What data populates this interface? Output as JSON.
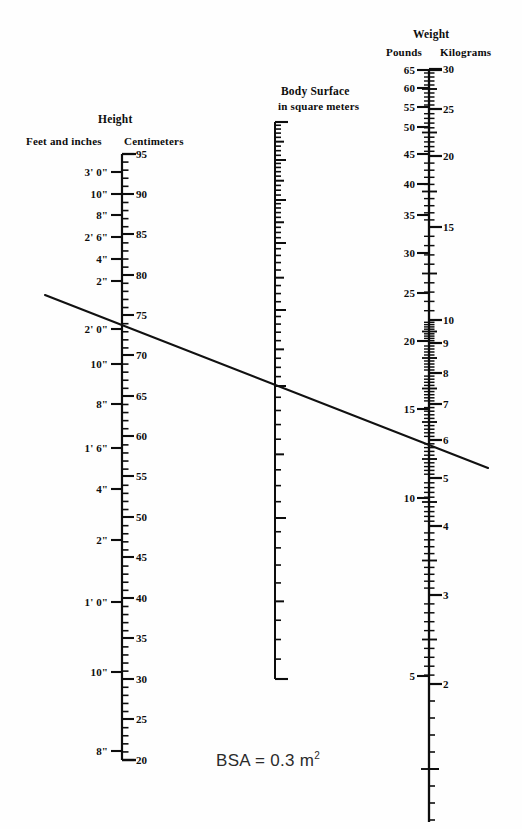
{
  "figure": {
    "kind": "bsa-nomogram",
    "result_text": "BSA = 0.3 m",
    "result_exponent": "2",
    "ink_color": "#0d0d0d",
    "background_color": "#fefefe",
    "reference_line_color": "#111111"
  },
  "height_scale": {
    "title": "Height",
    "left_header": "Feet and inches",
    "right_header": "Centimeters",
    "axis_x": 122,
    "top_y": 154,
    "bottom_y": 760,
    "cm_top": 95,
    "cm_bottom": 20,
    "cm_labels": [
      {
        "value": "95",
        "y": 154
      },
      {
        "value": "90",
        "y": 194
      },
      {
        "value": "85",
        "y": 234
      },
      {
        "value": "80",
        "y": 275
      },
      {
        "value": "75",
        "y": 315
      },
      {
        "value": "70",
        "y": 355
      },
      {
        "value": "65",
        "y": 396
      },
      {
        "value": "60",
        "y": 436
      },
      {
        "value": "55",
        "y": 476
      },
      {
        "value": "50",
        "y": 517
      },
      {
        "value": "45",
        "y": 557
      },
      {
        "value": "40",
        "y": 598
      },
      {
        "value": "35",
        "y": 638
      },
      {
        "value": "30",
        "y": 679
      },
      {
        "value": "25",
        "y": 719
      },
      {
        "value": "20",
        "y": 760
      }
    ],
    "feet_inch_labels": [
      {
        "value": "3' 0\"",
        "y": 172
      },
      {
        "value": "10\"",
        "y": 194
      },
      {
        "value": "8\"",
        "y": 215
      },
      {
        "value": "2' 6\"",
        "y": 237
      },
      {
        "value": "4\"",
        "y": 259
      },
      {
        "value": "2\"",
        "y": 281
      },
      {
        "value": "2' 0\"",
        "y": 329
      },
      {
        "value": "10\"",
        "y": 364
      },
      {
        "value": "8\"",
        "y": 404
      },
      {
        "value": "1' 6\"",
        "y": 448
      },
      {
        "value": "4\"",
        "y": 489
      },
      {
        "value": "2\"",
        "y": 540
      },
      {
        "value": "1' 0\"",
        "y": 602
      },
      {
        "value": "10\"",
        "y": 672
      },
      {
        "value": "8\"",
        "y": 751
      }
    ]
  },
  "bsa_scale": {
    "title_line1": "Body Surface",
    "title_line2": "in square meters",
    "axis_x": 275,
    "top_y": 122,
    "bottom_y": 679,
    "labels": [
      {
        "value": "0.8",
        "y": 122
      },
      {
        "value": "0.7",
        "y": 160
      },
      {
        "value": "0.6",
        "y": 200
      },
      {
        "value": "0.5",
        "y": 243
      },
      {
        "value": "0.4",
        "y": 310
      },
      {
        "value": "0.3",
        "y": 386
      },
      {
        "value": "0.2",
        "y": 518
      },
      {
        "value": "0.1",
        "y": 679
      }
    ]
  },
  "weight_scale": {
    "title": "Weight",
    "left_header": "Pounds",
    "right_header": "Kilograms",
    "axis_x": 429,
    "top_y": 70,
    "bottom_y": 822,
    "pound_labels": [
      {
        "value": "65",
        "y": 70
      },
      {
        "value": "60",
        "y": 88
      },
      {
        "value": "55",
        "y": 107
      },
      {
        "value": "50",
        "y": 127
      },
      {
        "value": "45",
        "y": 154
      },
      {
        "value": "40",
        "y": 184
      },
      {
        "value": "35",
        "y": 215
      },
      {
        "value": "30",
        "y": 253
      },
      {
        "value": "25",
        "y": 293
      },
      {
        "value": "20",
        "y": 341
      },
      {
        "value": "15",
        "y": 409
      },
      {
        "value": "10",
        "y": 498
      },
      {
        "value": "5",
        "y": 676
      }
    ],
    "kilogram_labels": [
      {
        "value": "30",
        "y": 69
      },
      {
        "value": "25",
        "y": 109
      },
      {
        "value": "20",
        "y": 156
      },
      {
        "value": "15",
        "y": 227
      },
      {
        "value": "10",
        "y": 320
      },
      {
        "value": "9",
        "y": 343
      },
      {
        "value": "8",
        "y": 373
      },
      {
        "value": "7",
        "y": 404
      },
      {
        "value": "6",
        "y": 440
      },
      {
        "value": "5",
        "y": 478
      },
      {
        "value": "4",
        "y": 526
      },
      {
        "value": "3",
        "y": 595
      },
      {
        "value": "2",
        "y": 684
      }
    ]
  },
  "reference_line": {
    "name": "bsa-reference-line",
    "x1": 45,
    "y1": 295,
    "x2": 488,
    "y2": 468,
    "crossings": {
      "height_cm": "60",
      "bsa_m2": "0.3",
      "weight_kg": "6"
    }
  }
}
